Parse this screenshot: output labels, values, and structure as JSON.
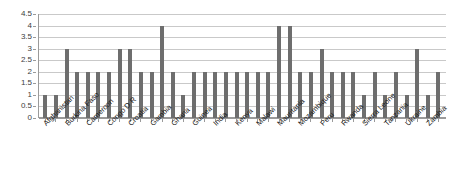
{
  "chart_data": {
    "type": "bar",
    "title": "",
    "subtitle": "",
    "xlabel": "",
    "ylabel": "",
    "ylim": [
      0,
      4.5
    ],
    "grid": true,
    "legend": null,
    "legend_position": "none",
    "bar_color": "#6e6e6e",
    "gridline_color": "#c9c9c9",
    "axis_color": "#9a9a9a",
    "y_ticks": [
      "0",
      "0.5",
      "1",
      "1.5",
      "2",
      "2.5",
      "3",
      "3.5",
      "4",
      "4.5"
    ],
    "y_tick_values": [
      0,
      0.5,
      1,
      1.5,
      2,
      2.5,
      3,
      3.5,
      4,
      4.5
    ],
    "tick_labels_shown": [
      "Afghanistan",
      "Burkina Faso",
      "Cameroon",
      "Congo D R",
      "Croatia",
      "Gambia",
      "Ghana",
      "Guinea",
      "India",
      "Kenya",
      "Malawi",
      "Mauritania",
      "Mozambique",
      "Peru",
      "Rwanda",
      "Sierra Leone",
      "Tanzania",
      "Ukraine",
      "Zambia"
    ],
    "categories": [
      "Afghanistan",
      "",
      "Burkina Faso",
      "",
      "Cameroon",
      "",
      "Congo D R",
      "",
      "Croatia",
      "",
      "Gambia",
      "",
      "Ghana",
      "",
      "Guinea",
      "",
      "India",
      "",
      "Kenya",
      "",
      "Malawi",
      "",
      "Mauritania",
      "",
      "Mozambique",
      "",
      "Peru",
      "",
      "Rwanda",
      "",
      "Sierra Leone",
      "",
      "Tanzania",
      "",
      "Ukraine",
      "",
      "Zambia",
      ""
    ],
    "values": [
      1,
      1,
      3,
      2,
      2,
      2,
      2,
      3,
      3,
      2,
      2,
      4,
      2,
      1,
      2,
      2,
      2,
      2,
      2,
      2,
      2,
      2,
      4,
      4,
      2,
      2,
      3,
      2,
      2,
      2,
      1,
      2,
      1,
      2,
      1,
      3,
      1,
      2
    ]
  }
}
